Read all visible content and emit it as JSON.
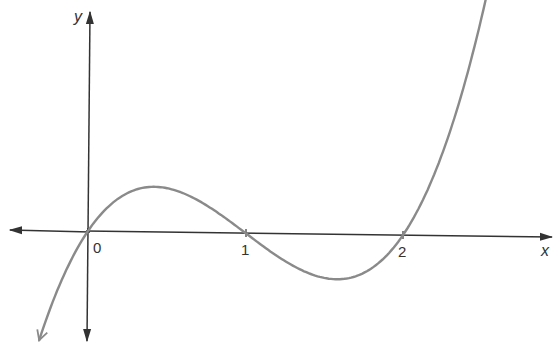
{
  "chart_data": {
    "type": "line",
    "title": "",
    "function": "y = x(x - 1)(x - 2)",
    "xlabel": "x",
    "ylabel": "y",
    "x_ticks": [
      "0",
      "1",
      "2"
    ],
    "x_tick_values": [
      0,
      1,
      2
    ],
    "zeros": [
      0,
      1,
      2
    ],
    "local_max": {
      "x": 0.42,
      "y": 0.38
    },
    "local_min": {
      "x": 1.58,
      "y": -0.38
    },
    "xlim": [
      -0.32,
      2.55
    ],
    "ylim": [
      -0.95,
      1.85
    ],
    "grid": false,
    "legend": null,
    "series": [
      {
        "name": "curve",
        "x_range": [
          -0.31,
          2.54
        ]
      }
    ]
  },
  "colors": {
    "axis": "#333333",
    "curve": "#8a8a8a",
    "background": "#ffffff"
  },
  "layout": {
    "origin_px": [
      88,
      231
    ],
    "px_per_unit_x": 157.5,
    "px_per_unit_y": 117
  }
}
